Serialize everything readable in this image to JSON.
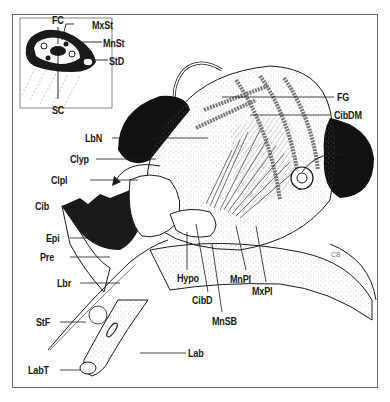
{
  "figure": {
    "inset": {
      "description": "Cross-section of stylet bundle",
      "labels": [
        {
          "id": "FC",
          "text": "FC"
        },
        {
          "id": "MxSt",
          "text": "MxSt"
        },
        {
          "id": "MnSt",
          "text": "MnSt"
        },
        {
          "id": "StD",
          "text": "StD"
        },
        {
          "id": "SC",
          "text": "SC"
        }
      ]
    },
    "labels_right": [
      {
        "id": "FG",
        "text": "FG"
      },
      {
        "id": "CibDM",
        "text": "CibDM"
      }
    ],
    "labels_left": [
      {
        "id": "LbN",
        "text": "LbN"
      },
      {
        "id": "Clyp",
        "text": "Clyp"
      },
      {
        "id": "Clpl",
        "text": "Clpl"
      },
      {
        "id": "Cib",
        "text": "Cib"
      },
      {
        "id": "Epi",
        "text": "Epi"
      },
      {
        "id": "Pre",
        "text": "Pre"
      },
      {
        "id": "Lbr",
        "text": "Lbr"
      },
      {
        "id": "StF",
        "text": "StF"
      },
      {
        "id": "LabT",
        "text": "LabT"
      }
    ],
    "labels_bottom": [
      {
        "id": "Hypo",
        "text": "Hypo"
      },
      {
        "id": "CibD",
        "text": "CibD"
      },
      {
        "id": "MnSB",
        "text": "MnSB"
      },
      {
        "id": "MnPl",
        "text": "MnPl"
      },
      {
        "id": "MxPl",
        "text": "MxPl"
      },
      {
        "id": "Lab",
        "text": "Lab"
      }
    ],
    "signature": "CB",
    "colors": {
      "ink": "#1a1a1a",
      "frame": "#6a6a6a",
      "background": "#ffffff",
      "stipple": "#9a9a9a"
    }
  }
}
